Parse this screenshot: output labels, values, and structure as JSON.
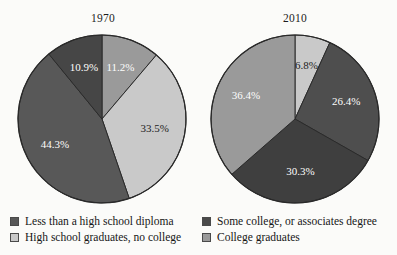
{
  "chart_data": [
    {
      "type": "pie",
      "title": "1970",
      "categories": [
        "High school graduates, no college",
        "Some college, or associates degree",
        "Less than a high school diploma",
        "College graduates"
      ],
      "values": [
        11.2,
        33.5,
        44.3,
        10.9
      ],
      "labels": [
        "11.2%",
        "33.5%",
        "44.3%",
        "10.9%"
      ],
      "colors": [
        "#9a9a9a",
        "#c9c9c9",
        "#585858",
        "#464646"
      ],
      "start_angle": 0,
      "direction": "clockwise",
      "units": "percent",
      "legend": "below",
      "grid": false
    },
    {
      "type": "pie",
      "title": "2010",
      "categories": [
        "Less than a high school diploma",
        "Some college, or associates degree",
        "College graduates",
        "High school graduates, no college"
      ],
      "values": [
        6.8,
        26.4,
        30.3,
        36.4
      ],
      "labels": [
        "6.8%",
        "26.4%",
        "30.3%",
        "36.4%"
      ],
      "colors": [
        "#c9c9c9",
        "#4e4e4e",
        "#3f3f3f",
        "#9a9a9a"
      ],
      "start_angle": 0,
      "direction": "clockwise",
      "units": "percent",
      "legend": "below",
      "grid": false
    }
  ],
  "panels": {
    "left": {
      "title": "1970"
    },
    "right": {
      "title": "2010"
    }
  },
  "legend": {
    "left": [
      {
        "label": "Less than a high school diploma",
        "color": "#585858"
      },
      {
        "label": "High school graduates, no college",
        "color": "#c9c9c9"
      }
    ],
    "right": [
      {
        "label": "Some college, or associates degree",
        "color": "#4a4a4a"
      },
      {
        "label": "College graduates",
        "color": "#9a9a9a"
      }
    ]
  },
  "slices": {
    "left": [
      {
        "label": "11.2%",
        "value": 11.2,
        "color": "#9a9a9a",
        "label_color": "light"
      },
      {
        "label": "33.5%",
        "value": 33.5,
        "color": "#c9c9c9",
        "label_color": "dark"
      },
      {
        "label": "44.3%",
        "value": 44.3,
        "color": "#585858",
        "label_color": "light"
      },
      {
        "label": "10.9%",
        "value": 10.9,
        "color": "#464646",
        "label_color": "light"
      }
    ],
    "right": [
      {
        "label": "6.8%",
        "value": 6.8,
        "color": "#c9c9c9",
        "label_color": "dark"
      },
      {
        "label": "26.4%",
        "value": 26.4,
        "color": "#4e4e4e",
        "label_color": "light"
      },
      {
        "label": "30.3%",
        "value": 30.3,
        "color": "#3f3f3f",
        "label_color": "light"
      },
      {
        "label": "36.4%",
        "value": 36.4,
        "color": "#9a9a9a",
        "label_color": "light"
      }
    ]
  }
}
